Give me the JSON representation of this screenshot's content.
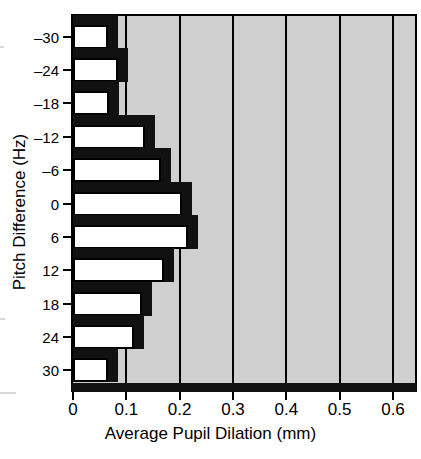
{
  "chart_data": {
    "type": "bar",
    "orientation": "horizontal",
    "title": "",
    "xlabel": "Average Pupil Dilation (mm)",
    "ylabel": "Pitch Difference (Hz)",
    "categories": [
      "-30",
      "-24",
      "-18",
      "-12",
      "-6",
      "0",
      "6",
      "12",
      "18",
      "24",
      "30"
    ],
    "values": [
      0.065,
      0.085,
      0.068,
      0.135,
      0.165,
      0.205,
      0.215,
      0.17,
      0.13,
      0.115,
      0.065
    ],
    "xlim": [
      0,
      0.6
    ],
    "xticks": [
      0,
      0.1,
      0.2,
      0.3,
      0.4,
      0.5,
      0.6
    ],
    "xtick_labels": [
      "0",
      "0.1",
      "0.2",
      "0.3",
      "0.4",
      "0.5",
      "0.6"
    ],
    "ytick_labels": [
      "–30",
      "–24",
      "–18",
      "–12",
      "–6",
      "0",
      "6",
      "12",
      "18",
      "24",
      "30"
    ],
    "grid": "vertical",
    "legend": "none",
    "series_name": "Average Pupil Dilation",
    "bar_face_color": "#ffffff",
    "bar_edge_color": "#000000",
    "bar_shadow_color": "#111111",
    "plot_background_color": "#cfcfcf",
    "page_background_color": "#ffffff"
  },
  "axes": {
    "x_title": "Average Pupil Dilation (mm)",
    "y_title": "Pitch Difference (Hz)"
  }
}
